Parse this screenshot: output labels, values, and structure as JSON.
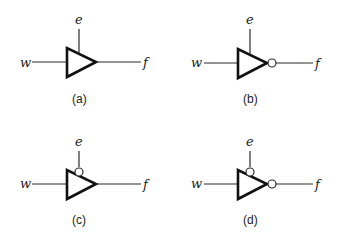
{
  "diagram": {
    "panels": [
      {
        "id": "a",
        "caption": "(a)",
        "input": "w",
        "enable": "e",
        "output": "f",
        "output_inverted": false,
        "enable_active_low": false
      },
      {
        "id": "b",
        "caption": "(b)",
        "input": "w",
        "enable": "e",
        "output": "f",
        "output_inverted": true,
        "enable_active_low": false
      },
      {
        "id": "c",
        "caption": "(c)",
        "input": "w",
        "enable": "e",
        "output": "f",
        "output_inverted": false,
        "enable_active_low": true
      },
      {
        "id": "d",
        "caption": "(d)",
        "input": "w",
        "enable": "e",
        "output": "f",
        "output_inverted": true,
        "enable_active_low": true
      }
    ]
  }
}
